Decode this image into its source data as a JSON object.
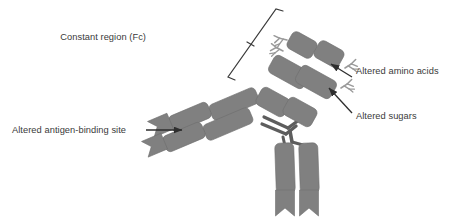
{
  "figure": {
    "type": "diagram",
    "background_color": "#ffffff",
    "domain_fill_color": "#808080",
    "domain_edge_color": "#6f6f6f",
    "line_color": "#3a3a3a",
    "text_color": "#3a3a3a",
    "sugar_color": "#9a9a9a"
  },
  "labels": {
    "constant_region": "Constant region (Fc)",
    "altered_amino_acids": "Altered amino acids",
    "altered_sugars": "Altered sugars",
    "altered_antigen_binding_site": "Altered antigen-binding site"
  },
  "annotations": {
    "bracket_name": "fc-bracket",
    "arrow_amino_acids": "arrow-to-altered-amino-acids",
    "arrow_sugars": "arrow-to-altered-sugars",
    "arrow_antigen_site": "arrow-to-antigen-binding-site"
  },
  "structure": {
    "arms": [
      {
        "name": "upper-left-arm",
        "role": "Fab arm with antigen-binding site",
        "domains": 4,
        "notched_tips": 2
      },
      {
        "name": "upper-right-arm",
        "role": "Fc constant region with glycans",
        "domains": 6,
        "notched_tips": 0
      },
      {
        "name": "lower-arm",
        "role": "Fab arm",
        "domains": 2,
        "notched_tips": 2
      }
    ],
    "hinge": "disulfide-hinge-struts",
    "glycan_clusters": 4
  }
}
